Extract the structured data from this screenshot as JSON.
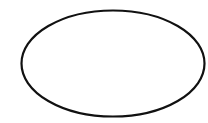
{
  "diagram": {
    "background": "#ffffff",
    "shapes": [
      {
        "type": "ellipse",
        "cx": 113,
        "cy": 63.5,
        "rx": 91.5,
        "ry": 53,
        "stroke": "#111111",
        "stroke_width": 2.2,
        "fill": "none",
        "label": ""
      }
    ]
  }
}
